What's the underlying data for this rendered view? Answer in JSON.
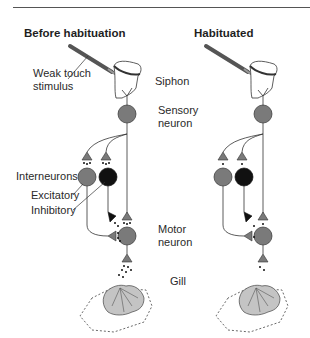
{
  "panels": [
    {
      "id": "before",
      "title": "Before habituation",
      "labels": {
        "stimulus": "Weak touch stimulus",
        "stimulus_line1": "Weak touch",
        "stimulus_line2": "stimulus",
        "siphon": "Siphon",
        "sensory_line1": "Sensory",
        "sensory_line2": "neuron",
        "interneurons": "Interneurons",
        "excitatory": "Excitatory",
        "inhibitory": "Inhibitory",
        "motor_line1": "Motor",
        "motor_line2": "neuron",
        "gill": "Gill"
      },
      "neurotransmitter_release": "many"
    },
    {
      "id": "habituated",
      "title": "Habituated",
      "neurotransmitter_release": "few"
    }
  ],
  "colors": {
    "neuron_gray": "#7a7a7a",
    "inhibitory_black": "#111111",
    "gill_fill": "#c4c4c4",
    "siphon_fill": "#ffffff",
    "line": "#333333"
  }
}
